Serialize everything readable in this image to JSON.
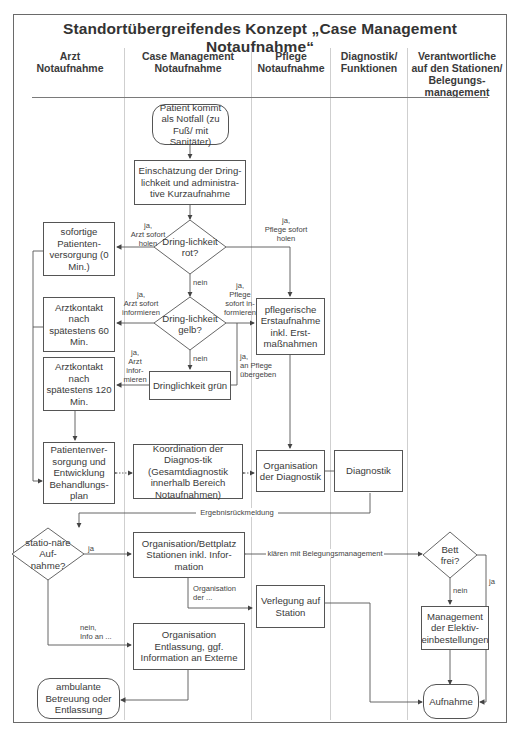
{
  "title": "Standortübergreifendes Konzept „Case Management Notaufnahme“",
  "lanes": [
    {
      "label": "Arzt\nNotaufnahme",
      "line1": "Arzt",
      "line2": "Notaufnahme"
    },
    {
      "label": "Case Management Notaufnahme",
      "line1": "Case Management",
      "line2": "Notaufnahme"
    },
    {
      "label": "Pflege Notaufnahme",
      "line1": "Pflege",
      "line2": "Notaufnahme"
    },
    {
      "label": "Diagnostik/ Funktionen",
      "line1": "Diagnostik/",
      "line2": "Funktionen"
    },
    {
      "label": "Verantwortliche auf den Stationen/ Belegungsmanagement",
      "line1": "Verantwortliche",
      "line2": "auf den Stationen/",
      "line3": "Belegungs-",
      "line4": "management"
    }
  ],
  "nodes": {
    "start": "Patient kommt als Notfall (zu Fuß/ mit Sanitäter)",
    "einschaetzung": "Einschätzung der Dring-lichkeit und administra-tive Kurzaufnahme",
    "rot": "Dring-lichkeit rot?",
    "sofortige": "sofortige Patienten-versorgung (0 Min.)",
    "gelb": "Dring-lichkeit gelb?",
    "arzt60": "Arztkontakt nach spätestens 60 Min.",
    "pflege_erst": "pflegerische Erstaufnahme inkl. Erst-maßnahmen",
    "gruen": "Dringlichkeit grün",
    "arzt120": "Arztkontakt nach spätestens 120 Min.",
    "behandlungsplan": "Patientenver-sorgung und Entwicklung Behandlungs-plan",
    "koordination": "Koordination der Diagnos-tik (Gesamtdiagnostik innerhalb Bereich Notaufnahmen)",
    "org_diagnostik": "Organisation der Diagnostik",
    "diagnostik": "Diagnostik",
    "stationaer": "statio-näre Auf-nahme?",
    "bettplatz": "Organisation/Bettplatz Stationen inkl. Infor-mation",
    "bett_frei": "Bett frei?",
    "verlegung": "Verlegung auf Station",
    "elektiv": "Management der Elektiv-einbestellungen",
    "entlassung": "Organisation Entlassung, ggf. Information an Externe",
    "ambulant": "ambulante Betreuung oder Entlassung",
    "aufnahme": "Aufnahme"
  },
  "edge_labels": {
    "rot_arzt": "ja,\nArzt sofort\nholen",
    "rot_pflege": "ja,\nPflege sofort\nholen",
    "rot_nein": "nein",
    "gelb_arzt": "ja,\nArzt sofort\ninformieren",
    "gelb_pflege": "ja,\nPflege\nsofort in-\nformieren",
    "gelb_nein": "nein",
    "gruen_arzt": "ja,\nArzt\ninfor-\nmieren",
    "gruen_pflege": "ja,\nan Pflege\nübergeben",
    "ergebnis": "Ergebnisrückmeldung",
    "stationaer_ja": "ja",
    "klaeren": "klären mit Belegungsmanagement",
    "org_der": "Organisation\nder ...",
    "nein_info": "nein,\nInfo an ...",
    "bett_ja": "ja",
    "bett_nein": "nein"
  },
  "colors": {
    "line": "#555555",
    "lane_divider": "#cfcfcf",
    "frame": "#6a6a6a",
    "text": "#3a3a3a"
  }
}
